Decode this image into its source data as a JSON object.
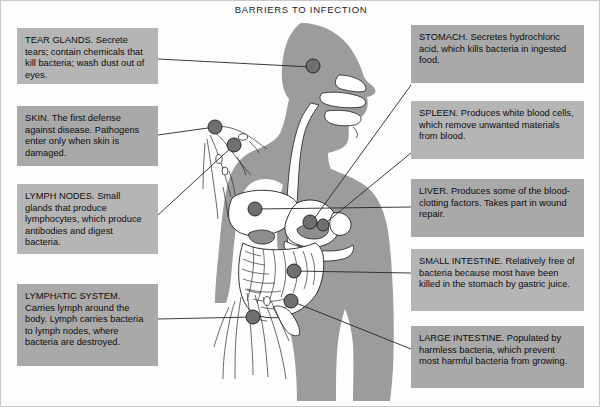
{
  "diagram": {
    "title": "BARRIERS TO INFECTION",
    "figure_name": "human-body-silhouette",
    "colors": {
      "page_background": "#ffffff",
      "body_silhouette": "#9c9c9c",
      "callout_background": "#b5b5b5",
      "callout_background_dark": "#a9a9a9",
      "marker": "#6f6f6f",
      "line": "#262626",
      "text": "#0d0d0d"
    },
    "callouts_left": [
      {
        "id": "tear-glands",
        "label": "TEAR GLANDS. Secrete tears; contain chemicals that kill bacteria; wash dust out of eyes."
      },
      {
        "id": "skin",
        "label": "SKIN. The first defense against disease. Pathogens enter only when skin is damaged."
      },
      {
        "id": "lymph-nodes",
        "label": "LYMPH NODES. Small glands that produce lymphocytes, which produce antibodies and digest bacteria."
      },
      {
        "id": "lymphatic-system",
        "label": "LYMPHATIC SYSTEM. Carries lymph around the body. Lymph carries bacteria to lymph nodes, where bacteria are destroyed."
      }
    ],
    "callouts_right": [
      {
        "id": "stomach",
        "label": "STOMACH. Secretes hydrochloric acid, which kills bacteria in ingested food."
      },
      {
        "id": "spleen",
        "label": "SPLEEN. Produces white blood cells, which remove unwanted materials from blood."
      },
      {
        "id": "liver",
        "label": "LIVER. Produces some of the blood-clotting factors. Takes part in wound repair."
      },
      {
        "id": "small-intestine",
        "label": "SMALL INTESTINE. Relatively free of bacteria because most have been killed in the stomach by gastric juice."
      },
      {
        "id": "large-intestine",
        "label": "LARGE INTESTINE. Populated by harmless bacteria, which prevent most harmful bacteria from growing."
      }
    ]
  }
}
